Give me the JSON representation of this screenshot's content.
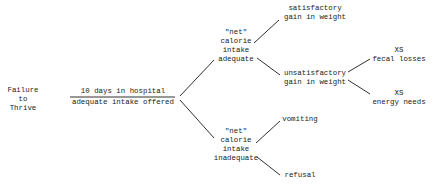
{
  "diagram": {
    "root": {
      "lines": [
        "Failure",
        "to",
        "Thrive"
      ]
    },
    "stage": {
      "top": "10 days in hospital",
      "bottom": "adequate intake offered"
    },
    "adequate": {
      "lines": [
        "\"net\"",
        "calorie",
        "intake",
        "adequate"
      ]
    },
    "inadequate": {
      "lines": [
        "\"net\"",
        "calorie",
        "intake",
        "inadequate"
      ]
    },
    "satisfactory": {
      "lines": [
        "satisfactory",
        "gain in weight"
      ]
    },
    "unsatisfactory": {
      "lines": [
        "unsatisfactory",
        "gain in weight"
      ]
    },
    "fecal": {
      "lines": [
        "XS",
        "fecal losses"
      ]
    },
    "energy": {
      "lines": [
        "XS",
        "energy needs"
      ]
    },
    "vomiting": {
      "lines": [
        "vomiting"
      ]
    },
    "refusal": {
      "lines": [
        "refusal"
      ]
    }
  }
}
